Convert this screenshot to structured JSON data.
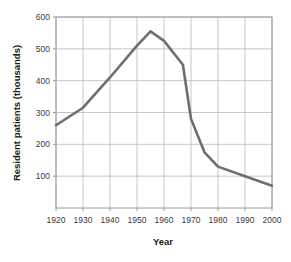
{
  "chart_data": {
    "type": "line",
    "title": "",
    "xlabel": "Year",
    "ylabel": "Resident patients (thousands)",
    "xlim": [
      1920,
      2000
    ],
    "ylim": [
      0,
      600
    ],
    "xticks": [
      1920,
      1930,
      1940,
      1950,
      1960,
      1970,
      1980,
      1990,
      2000
    ],
    "xtick_labels": [
      "1920",
      "1930",
      "1940",
      "1950",
      "1960",
      "1970",
      "1980",
      "1990",
      "2000"
    ],
    "yticks": [
      100,
      200,
      300,
      400,
      500,
      600
    ],
    "ytick_labels": [
      "100",
      "200",
      "300",
      "400",
      "500",
      "600"
    ],
    "grid": true,
    "legend": "none",
    "line_color": "#6e6e6e",
    "grid_color": "#b9b9b9",
    "axis_color": "#9a9a9a",
    "background_color": "#ffffff",
    "series": [
      {
        "name": "Resident patients",
        "x": [
          1920,
          1930,
          1940,
          1950,
          1955,
          1960,
          1967,
          1970,
          1975,
          1980,
          1990,
          2000
        ],
        "values": [
          260,
          315,
          410,
          510,
          555,
          525,
          450,
          280,
          175,
          130,
          100,
          70
        ]
      }
    ]
  }
}
